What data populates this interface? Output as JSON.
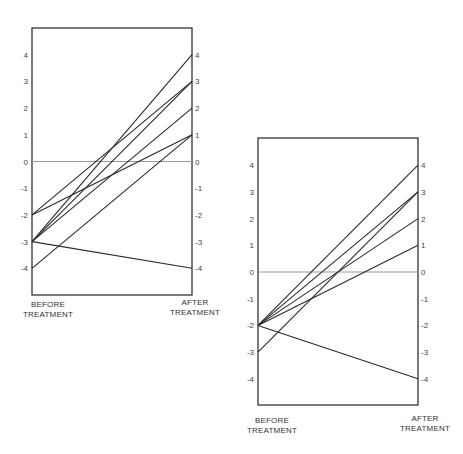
{
  "chart_data": [
    {
      "type": "line",
      "title": "",
      "xlabel": "",
      "ylabel": "",
      "categories": [
        "BEFORE TREATMENT",
        "AFTER TREATMENT"
      ],
      "ylim": [
        -5,
        5
      ],
      "yticks": [
        4,
        3,
        2,
        1,
        0,
        -1,
        -2,
        -3,
        -4
      ],
      "zero_line": true,
      "grid": false,
      "series": [
        {
          "name": "subject-1",
          "values": [
            -2,
            3
          ]
        },
        {
          "name": "subject-2",
          "values": [
            -2,
            1
          ]
        },
        {
          "name": "subject-3",
          "values": [
            -3,
            4
          ]
        },
        {
          "name": "subject-4",
          "values": [
            -3,
            3
          ]
        },
        {
          "name": "subject-5",
          "values": [
            -3,
            2
          ]
        },
        {
          "name": "subject-6",
          "values": [
            -3,
            -4
          ]
        },
        {
          "name": "subject-7",
          "values": [
            -4,
            1
          ]
        }
      ]
    },
    {
      "type": "line",
      "title": "",
      "xlabel": "",
      "ylabel": "",
      "categories": [
        "BEFORE TREATMENT",
        "AFTER TREATMENT"
      ],
      "ylim": [
        -5,
        5
      ],
      "yticks": [
        4,
        3,
        2,
        1,
        0,
        -1,
        -2,
        -3,
        -4
      ],
      "zero_line": true,
      "grid": false,
      "series": [
        {
          "name": "subject-1",
          "values": [
            -2,
            4
          ]
        },
        {
          "name": "subject-2",
          "values": [
            -2,
            3
          ]
        },
        {
          "name": "subject-3",
          "values": [
            -2,
            2
          ]
        },
        {
          "name": "subject-4",
          "values": [
            -2,
            1
          ]
        },
        {
          "name": "subject-5",
          "values": [
            -2,
            -4
          ]
        },
        {
          "name": "subject-6",
          "values": [
            -3,
            3
          ]
        }
      ]
    }
  ],
  "labels": {
    "chart1": {
      "before": "BEFORE\nTREATMENT",
      "after": "AFTER\nTREATMENT"
    },
    "chart2": {
      "before": "BEFORE\nTREATMENT",
      "after": "AFTER\nTREATMENT"
    }
  },
  "colors": {
    "line": "#2a2a2a",
    "frame": "#333333",
    "zero_line": "#999999"
  }
}
